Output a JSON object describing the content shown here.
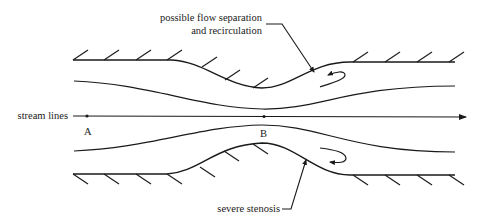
{
  "diagram": {
    "labels": {
      "separation_line1": "possible flow separation",
      "separation_line2": "and recirculation",
      "stream_lines": "stream lines",
      "point_a": "A",
      "point_b": "B",
      "stenosis": "severe stenosis"
    },
    "colors": {
      "stroke": "#1a1a1a",
      "background": "#ffffff"
    }
  }
}
